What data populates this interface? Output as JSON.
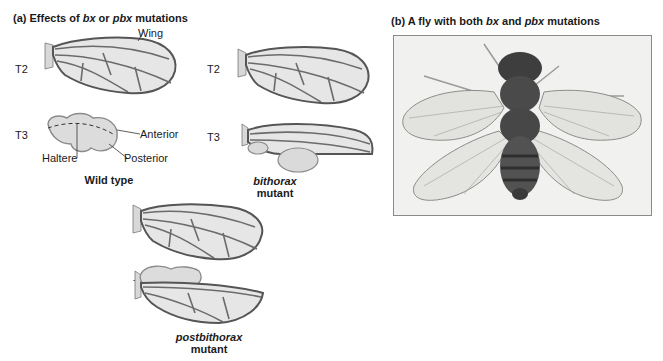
{
  "panel_a": {
    "title_prefix": "(a) Effects of ",
    "title_bx": "bx",
    "title_mid": " or ",
    "title_pbx": "pbx",
    "title_suffix": " mutations",
    "wild_type": {
      "t2_label": "T2",
      "t3_label": "T3",
      "wing_label": "Wing",
      "anterior_label": "Anterior",
      "posterior_label": "Posterior",
      "haltere_label": "Haltere",
      "caption": "Wild type"
    },
    "bithorax": {
      "t2_label": "T2",
      "t3_label": "T3",
      "caption_italic": "bithorax",
      "caption_plain": "mutant"
    },
    "postbithorax": {
      "t2_label": "T2",
      "t3_label": "T3",
      "caption_italic": "postbithorax",
      "caption_plain": "mutant"
    }
  },
  "panel_b": {
    "title_prefix": "(b) A fly with both ",
    "title_bx": "bx",
    "title_mid": " and ",
    "title_pbx": "pbx",
    "title_suffix": " mutations",
    "photo_subject": "four-winged fly photograph"
  },
  "colors": {
    "wing_fill": "#e4e4e4",
    "wing_stroke": "#5a5a5a",
    "vein": "#6b6b6b",
    "haltere_fill": "#d9d9d9",
    "photo_bg": "#f1f1ef",
    "fly_body": "#4a4a4a"
  }
}
